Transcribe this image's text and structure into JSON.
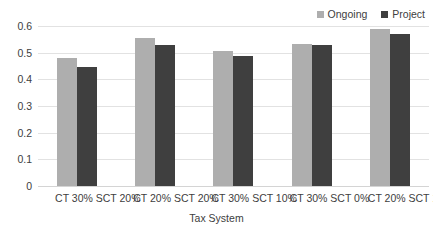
{
  "chart_data": {
    "type": "bar",
    "title": "",
    "xlabel": "Tax System",
    "ylabel": "",
    "categories": [
      "CT 30% SCT 20%",
      "CT 20% SCT 20%",
      "CT 30% SCT 10%",
      "CT 30% SCT 0%",
      "CT 20% SCT 10%"
    ],
    "series": [
      {
        "name": "Ongoing",
        "color": "#AEAEAE",
        "values": [
          0.48,
          0.555,
          0.506,
          0.534,
          0.588
        ]
      },
      {
        "name": "Project",
        "color": "#3F3F3F",
        "values": [
          0.445,
          0.527,
          0.489,
          0.528,
          0.57
        ]
      }
    ],
    "ylim": [
      0,
      0.6
    ],
    "yticks": [
      "0",
      "0.1",
      "0.2",
      "0.3",
      "0.4",
      "0.5",
      "0.6"
    ],
    "ytick_values": [
      0,
      0.1,
      0.2,
      0.3,
      0.4,
      0.5,
      0.6
    ],
    "grid": true,
    "legend_position": "top-right"
  },
  "legend": {
    "items": [
      {
        "label": "Ongoing",
        "color": "#AEAEAE"
      },
      {
        "label": "Project",
        "color": "#3F3F3F"
      }
    ]
  },
  "axes": {
    "x_title": "Tax System"
  }
}
